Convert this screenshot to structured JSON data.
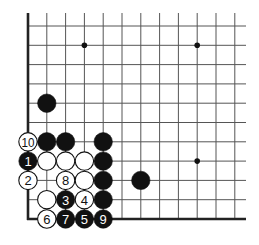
{
  "board": {
    "origin_x": 28,
    "origin_y": 26,
    "dx": 18.8,
    "dy": 19.3,
    "cols": 12,
    "rows": 11,
    "line_extend_right": 246,
    "line_extend_top": 13,
    "edges": [
      "left",
      "bottom"
    ],
    "line_color": "#555555",
    "edge_color": "#222222"
  },
  "star_points": [
    {
      "col": 3,
      "row": 1
    },
    {
      "col": 9,
      "row": 1
    },
    {
      "col": 9,
      "row": 7
    }
  ],
  "stones": [
    {
      "col": 1,
      "row": 4,
      "color": "black",
      "label": ""
    },
    {
      "col": 0,
      "row": 6,
      "color": "white",
      "label": "10"
    },
    {
      "col": 1,
      "row": 6,
      "color": "black",
      "label": ""
    },
    {
      "col": 2,
      "row": 6,
      "color": "black",
      "label": ""
    },
    {
      "col": 4,
      "row": 6,
      "color": "black",
      "label": ""
    },
    {
      "col": 0,
      "row": 7,
      "color": "black",
      "label": "1"
    },
    {
      "col": 1,
      "row": 7,
      "color": "white",
      "label": ""
    },
    {
      "col": 2,
      "row": 7,
      "color": "white",
      "label": ""
    },
    {
      "col": 3,
      "row": 7,
      "color": "white",
      "label": ""
    },
    {
      "col": 4,
      "row": 7,
      "color": "black",
      "label": ""
    },
    {
      "col": 0,
      "row": 8,
      "color": "white",
      "label": "2"
    },
    {
      "col": 2,
      "row": 8,
      "color": "white",
      "label": "8"
    },
    {
      "col": 3,
      "row": 8,
      "color": "white",
      "label": ""
    },
    {
      "col": 4,
      "row": 8,
      "color": "black",
      "label": ""
    },
    {
      "col": 6,
      "row": 8,
      "color": "black",
      "label": ""
    },
    {
      "col": 1,
      "row": 9,
      "color": "white",
      "label": ""
    },
    {
      "col": 2,
      "row": 9,
      "color": "black",
      "label": "3"
    },
    {
      "col": 3,
      "row": 9,
      "color": "white",
      "label": "4"
    },
    {
      "col": 4,
      "row": 9,
      "color": "black",
      "label": ""
    },
    {
      "col": 1,
      "row": 10,
      "color": "white",
      "label": "6"
    },
    {
      "col": 2,
      "row": 10,
      "color": "black",
      "label": "7"
    },
    {
      "col": 3,
      "row": 10,
      "color": "black",
      "label": "5"
    },
    {
      "col": 4,
      "row": 10,
      "color": "black",
      "label": "9"
    }
  ]
}
